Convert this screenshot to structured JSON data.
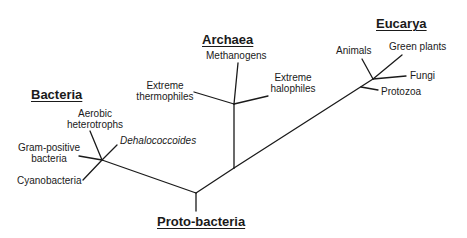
{
  "diagram": {
    "type": "phylogenetic-tree",
    "line_color": "#1a1a1a",
    "groups": {
      "bacteria": "Bacteria",
      "archaea": "Archaea",
      "eucarya": "Eucarya",
      "protobacteria": "Proto-bacteria"
    },
    "leaves": {
      "aerobic_heterotrophs_1": "Aerobic",
      "aerobic_heterotrophs_2": "heterotrophs",
      "dehalococcoides": "Dehalococcoides",
      "gram_positive_1": "Gram-positive",
      "gram_positive_2": "bacteria",
      "cyanobacteria": "Cyanobacteria",
      "methanogens": "Methanogens",
      "extreme_thermophiles_1": "Extreme",
      "extreme_thermophiles_2": "thermophiles",
      "extreme_halophiles_1": "Extreme",
      "extreme_halophiles_2": "halophiles",
      "animals": "Animals",
      "green_plants": "Green plants",
      "fungi": "Fungi",
      "protozoa": "Protozoa"
    }
  }
}
